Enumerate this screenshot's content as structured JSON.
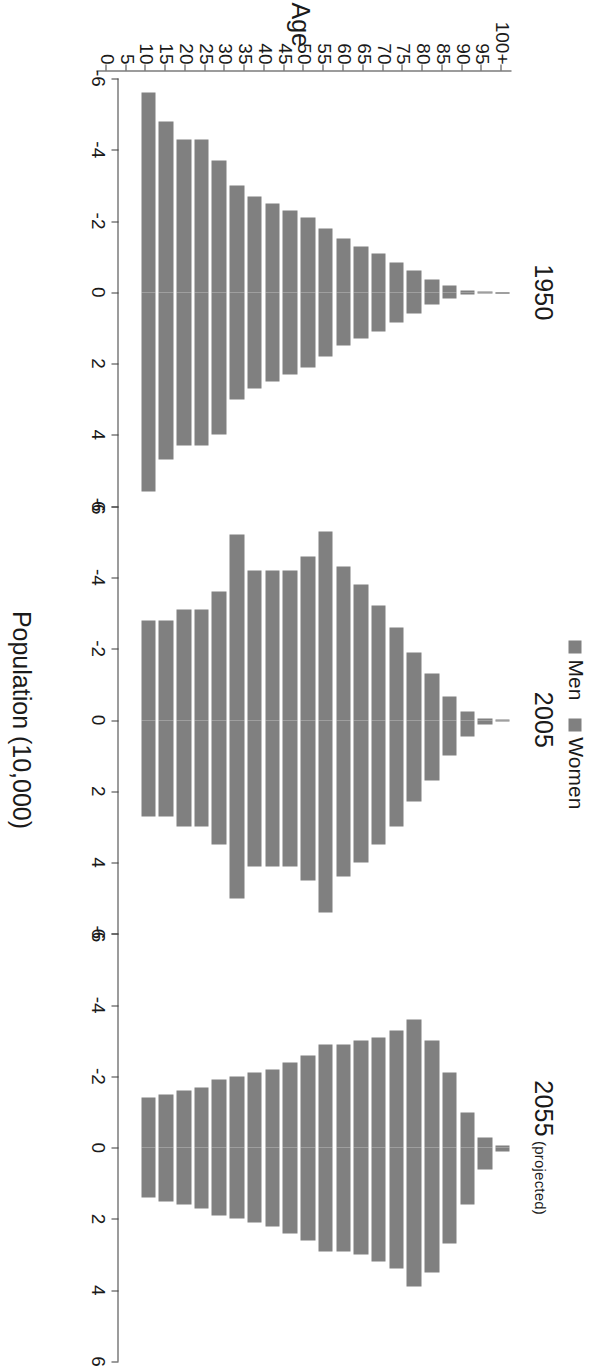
{
  "figure": {
    "axis_title_y": "Age",
    "axis_title_x": "Population (10,000)",
    "legend": [
      {
        "label": "Men",
        "color": "#808080"
      },
      {
        "label": "Women",
        "color": "#808080"
      }
    ]
  },
  "panels": [
    {
      "title": "1950",
      "subtitle": ""
    },
    {
      "title": "2005",
      "subtitle": ""
    },
    {
      "title": "2055",
      "subtitle": "(projected)"
    }
  ],
  "axis": {
    "x_ticks": [
      "-6",
      "-4",
      "-2",
      "0",
      "2",
      "4",
      "6"
    ],
    "x_values": [
      -6,
      -4,
      -2,
      0,
      2,
      4,
      6
    ],
    "y_ticks": [
      "0",
      "5",
      "10",
      "15",
      "20",
      "25",
      "30",
      "35",
      "40",
      "45",
      "50",
      "55",
      "60",
      "65",
      "70",
      "75",
      "80",
      "85",
      "90",
      "95",
      "100+"
    ]
  },
  "chart_data": {
    "type": "bar",
    "subtype": "population-pyramid",
    "title": "",
    "xlabel": "Population (10,000)",
    "ylabel": "Age",
    "xlim": [
      -6,
      6
    ],
    "grid": false,
    "legend_position": "top-center",
    "units": "10,000 people",
    "note": "Men plotted as negative (left), Women as positive (right). Three panels: 1950, 2005, 2055 (projected).",
    "categories": [
      "0",
      "5",
      "10",
      "15",
      "20",
      "25",
      "30",
      "35",
      "40",
      "45",
      "50",
      "55",
      "60",
      "65",
      "70",
      "75",
      "80",
      "85",
      "90",
      "95",
      "100+"
    ],
    "panels": [
      {
        "name": "1950",
        "series": [
          {
            "name": "Men",
            "values": [
              -5.6,
              -4.8,
              -4.3,
              -4.3,
              -3.7,
              -3.0,
              -2.7,
              -2.5,
              -2.3,
              -2.1,
              -1.8,
              -1.5,
              -1.3,
              -1.1,
              -0.85,
              -0.6,
              -0.35,
              -0.18,
              -0.06,
              -0.015,
              -0.004
            ]
          },
          {
            "name": "Women",
            "values": [
              5.6,
              4.7,
              4.3,
              4.3,
              4.0,
              3.0,
              2.7,
              2.5,
              2.3,
              2.1,
              1.8,
              1.5,
              1.3,
              1.1,
              0.85,
              0.6,
              0.35,
              0.18,
              0.06,
              0.015,
              0.004
            ]
          }
        ]
      },
      {
        "name": "2005",
        "series": [
          {
            "name": "Men",
            "values": [
              -2.8,
              -2.8,
              -3.1,
              -3.1,
              -3.6,
              -5.2,
              -4.2,
              -4.2,
              -4.2,
              -4.6,
              -5.3,
              -4.3,
              -3.8,
              -3.2,
              -2.6,
              -1.9,
              -1.3,
              -0.65,
              -0.25,
              -0.05,
              -0.008
            ]
          },
          {
            "name": "Women",
            "values": [
              2.7,
              2.7,
              3.0,
              3.0,
              3.5,
              5.0,
              4.1,
              4.1,
              4.1,
              4.5,
              5.4,
              4.4,
              4.0,
              3.5,
              3.0,
              2.3,
              1.7,
              1.0,
              0.45,
              0.12,
              0.02
            ]
          }
        ]
      },
      {
        "name": "2055",
        "series": [
          {
            "name": "Men",
            "values": [
              -1.4,
              -1.5,
              -1.6,
              -1.7,
              -1.9,
              -2.0,
              -2.1,
              -2.2,
              -2.4,
              -2.6,
              -2.9,
              -2.9,
              -3.0,
              -3.1,
              -3.3,
              -3.6,
              -3.0,
              -2.1,
              -1.0,
              -0.3,
              -0.05
            ]
          },
          {
            "name": "Women",
            "values": [
              1.4,
              1.5,
              1.6,
              1.7,
              1.9,
              2.0,
              2.1,
              2.2,
              2.4,
              2.6,
              2.9,
              2.9,
              3.0,
              3.2,
              3.4,
              3.9,
              3.5,
              2.7,
              1.6,
              0.6,
              0.12
            ]
          }
        ]
      }
    ]
  }
}
